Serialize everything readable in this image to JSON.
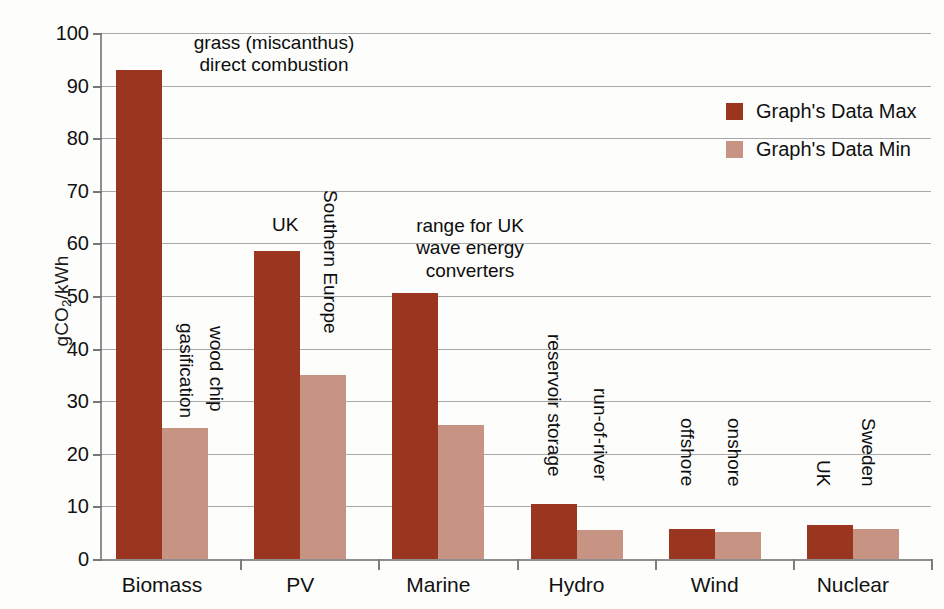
{
  "chart_data": {
    "type": "bar",
    "title": "",
    "subtitle": "",
    "xlabel": "",
    "ylabel": "gCO2/kWh",
    "ylabel_parts": {
      "pre": "gCO",
      "sub": "2",
      "post": "/kWh"
    },
    "ylim": [
      0,
      100
    ],
    "ytick_step": 10,
    "yticks": [
      "0",
      "10",
      "20",
      "30",
      "40",
      "50",
      "60",
      "70",
      "80",
      "90",
      "100"
    ],
    "grid": true,
    "legend_position": "top-right",
    "categories": [
      "Biomass",
      "PV",
      "Marine",
      "Hydro",
      "Wind",
      "Nuclear"
    ],
    "series": [
      {
        "name": "Graph's Data Max",
        "color": "#9a3520",
        "values": [
          93,
          58.5,
          50.5,
          10.5,
          5.8,
          6.5
        ]
      },
      {
        "name": "Graph's Data Min",
        "color": "#c79383",
        "values": [
          25,
          35,
          25.5,
          5.5,
          5.2,
          5.7
        ]
      }
    ],
    "annotations": [
      {
        "key": "biomass_top",
        "text": "grass (miscanthus)\ndirect combustion"
      },
      {
        "key": "biomass_max_bar",
        "text": "gasification"
      },
      {
        "key": "biomass_min_bar",
        "text": "wood chip"
      },
      {
        "key": "pv_max_bar",
        "text": "UK"
      },
      {
        "key": "pv_min_bar",
        "text": "Southern Europe"
      },
      {
        "key": "marine_top",
        "text": "range for UK\nwave energy\nconverters"
      },
      {
        "key": "hydro_max_bar",
        "text": "reservoir storage"
      },
      {
        "key": "hydro_min_bar",
        "text": "run-of-river"
      },
      {
        "key": "wind_max_bar",
        "text": "offshore"
      },
      {
        "key": "wind_min_bar",
        "text": "onshore"
      },
      {
        "key": "nuclear_max_bar",
        "text": "UK"
      },
      {
        "key": "nuclear_min_bar",
        "text": "Sweden"
      }
    ]
  },
  "legend": {
    "items": [
      {
        "label": "Graph's Data Max",
        "color": "#9a3520"
      },
      {
        "label": "Graph's Data Min",
        "color": "#c79383"
      }
    ]
  },
  "colors": {
    "max_bar": "#9a3520",
    "min_bar": "#c79383",
    "grid": "#a9a9a9",
    "axis": "#8e8e8e",
    "text": "#111111",
    "background": "#fdfdfc"
  }
}
